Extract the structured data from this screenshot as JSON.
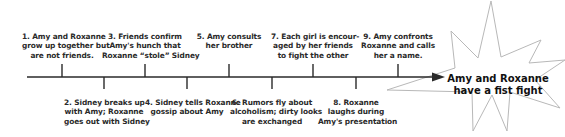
{
  "diagram": {
    "type": "timeline",
    "colors": {
      "line": "#2a2a2a",
      "star_stroke": "#b8b8b8",
      "text": "#2a2a2a"
    },
    "events_above": [
      {
        "id": 1,
        "lines": [
          "1. Amy and Roxanne",
          "grow up together but",
          "are not friends."
        ],
        "tick_x": 62
      },
      {
        "id": 3,
        "lines": [
          "3. Friends confirm",
          "Amy's hunch that",
          "Roxanne “stole” Sidney"
        ],
        "tick_x": 145
      },
      {
        "id": 5,
        "lines": [
          "5. Amy consults",
          "her brother"
        ],
        "tick_x": 229
      },
      {
        "id": 7,
        "lines": [
          "7. Each girl is encour-",
          "aged by her friends",
          "to fight the other"
        ],
        "tick_x": 313
      },
      {
        "id": 9,
        "lines": [
          "9. Amy confronts",
          "Roxanne and calls",
          "her a name."
        ],
        "tick_x": 398
      }
    ],
    "events_below": [
      {
        "id": 2,
        "lines": [
          "2. Sidney breaks up",
          "with Amy; Roxanne",
          "goes out with Sidney"
        ],
        "tick_x": 104
      },
      {
        "id": 4,
        "lines": [
          "4. Sidney tells Roxanne",
          "gossip about Amy"
        ],
        "tick_x": 187
      },
      {
        "id": 6,
        "lines": [
          "6. Rumors fly about",
          "alcoholism; dirty looks",
          "are exchanged"
        ],
        "tick_x": 272
      },
      {
        "id": 8,
        "lines": [
          "8. Roxanne",
          "laughs during",
          "Amy's presentation"
        ],
        "tick_x": 356
      }
    ],
    "climax": {
      "lines": [
        "Amy and Roxanne",
        "have a fist fight"
      ],
      "shape": "starburst"
    }
  }
}
